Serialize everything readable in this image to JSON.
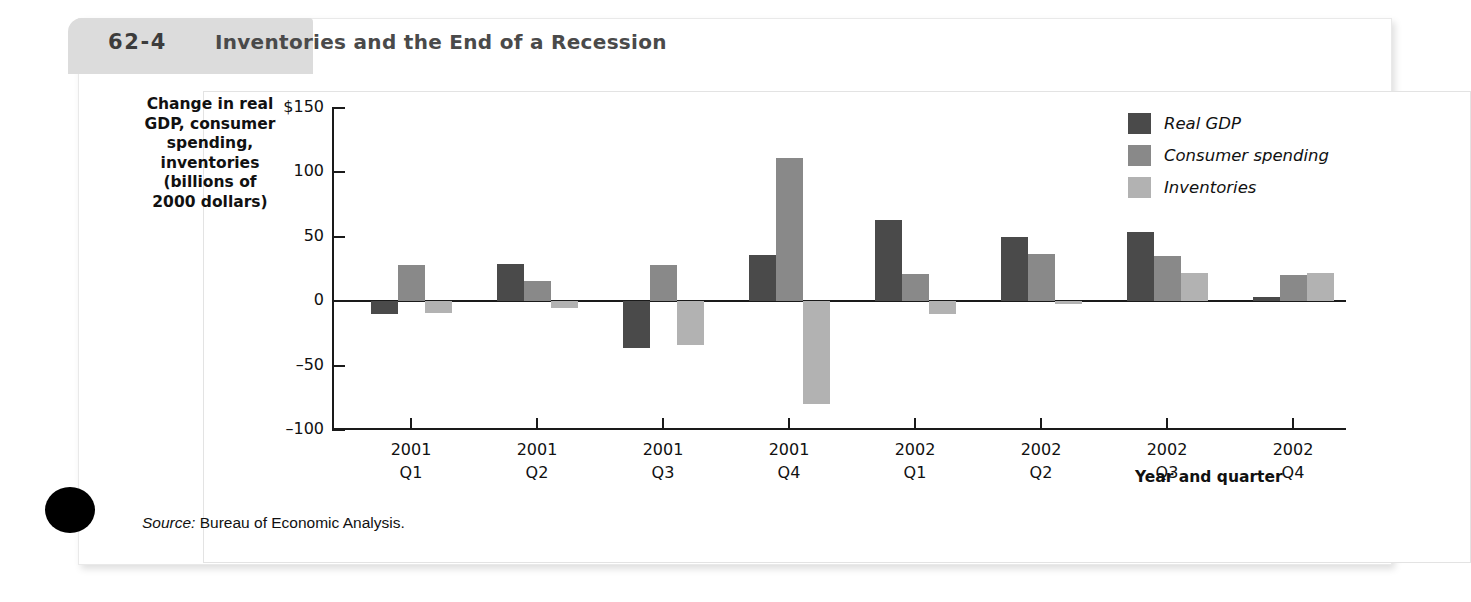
{
  "figure": {
    "label_word": "FIGURE",
    "number": "62-4",
    "title": "Inventories and the End of a Recession",
    "source": "Source:",
    "source_text": " Bureau of Economic Analysis."
  },
  "colors": {
    "real_gdp": "#4a4a4a",
    "consumer_spending": "#898989",
    "inventories": "#b2b2b2",
    "axis": "#1a1a1a"
  },
  "chart_data": {
    "type": "bar",
    "title": "Inventories and the End of a Recession",
    "xlabel": "Year and quarter",
    "ylabel": "Change in real GDP, consumer spending, inventories (billions of 2000 dollars)",
    "ylabel_lines": [
      "Change in real",
      "GDP, consumer",
      "spending,",
      "inventories",
      "(billions of",
      "2000 dollars)"
    ],
    "categories": [
      "2001 Q1",
      "2001 Q2",
      "2001 Q3",
      "2001 Q4",
      "2002 Q1",
      "2002 Q2",
      "2002 Q3",
      "2002 Q4"
    ],
    "category_lines": [
      [
        "2001",
        "Q1"
      ],
      [
        "2001",
        "Q2"
      ],
      [
        "2001",
        "Q3"
      ],
      [
        "2001",
        "Q4"
      ],
      [
        "2002",
        "Q1"
      ],
      [
        "2002",
        "Q2"
      ],
      [
        "2002",
        "Q3"
      ],
      [
        "2002",
        "Q4"
      ]
    ],
    "series": [
      {
        "name": "Real GDP",
        "color": "#4a4a4a",
        "values": [
          -10,
          29,
          -36,
          36,
          63,
          50,
          54,
          3
        ]
      },
      {
        "name": "Consumer spending",
        "color": "#898989",
        "values": [
          28,
          16,
          28,
          111,
          21,
          37,
          35,
          20
        ]
      },
      {
        "name": "Inventories",
        "color": "#b2b2b2",
        "values": [
          -9,
          -5,
          -34,
          -80,
          -10,
          -2,
          22,
          22
        ]
      }
    ],
    "ylim": [
      -100,
      150
    ],
    "yticks": [
      150,
      100,
      50,
      0,
      -50,
      -100
    ],
    "ytick_labels": [
      "$150",
      "100",
      "50",
      "0",
      "–50",
      "–100"
    ],
    "grid": false,
    "legend_position": "top-right"
  }
}
